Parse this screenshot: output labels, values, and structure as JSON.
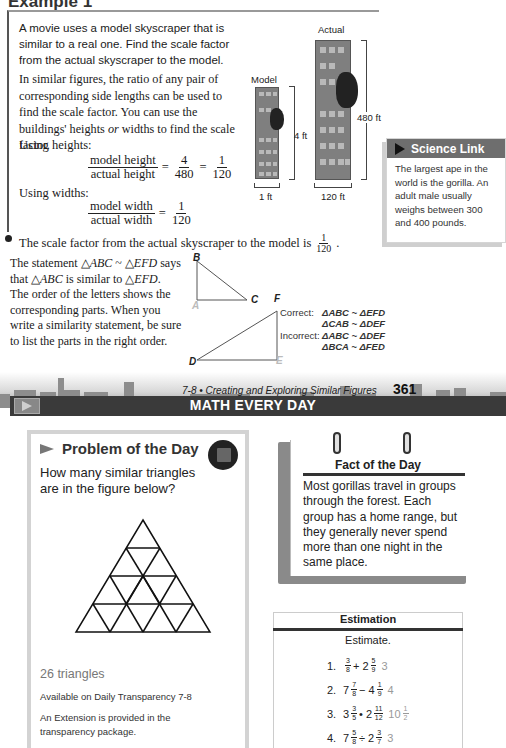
{
  "example": {
    "title": "Example 1",
    "intro": "A movie uses a model skyscraper that is similar to a real one. Find the scale factor from the actual skyscraper to the model.",
    "explain_pre": "In similar figures, the ratio of any pair of corresponding side lengths can be used to find the scale factor. You can use the buildings' heights ",
    "explain_or": "or",
    "explain_post": " widths to find the scale factor.",
    "using_heights": "Using heights:",
    "eq_heights": {
      "num1": "model height",
      "den1": "actual height",
      "eq": "=",
      "num2": "4",
      "den2": "480",
      "eq2": "=",
      "num3": "1",
      "den3": "120"
    },
    "using_widths": "Using widths:",
    "eq_widths": {
      "num1": "model width",
      "den1": "actual width",
      "eq": "=",
      "num2": "1",
      "den2": "120"
    },
    "conclusion": "The scale factor from the actual skyscraper to the model is",
    "conclusion_num": "1",
    "conclusion_den": "120",
    "conclusion_end": "."
  },
  "figure": {
    "model_label": "Model",
    "actual_label": "Actual",
    "model_height": "4 ft",
    "actual_height": "480 ft",
    "model_width": "1 ft",
    "actual_width": "120 ft"
  },
  "science_link": {
    "title": "Science Link",
    "body": "The largest ape in the world is the gorilla. An adult male usually weighs between 300 and 400 pounds."
  },
  "similarity": {
    "text_1": "The statement △",
    "abc": "ABC",
    "sim": " ~ △",
    "efd": "EFD",
    "text_2": " says that △",
    "abc2": "ABC",
    "text_3": " is similar to △",
    "efd2": "EFD",
    "text_4": ". The order of the letters shows the corresponding parts. When you write a similarity statement, be sure to list the parts in the right order.",
    "labels": {
      "A": "A",
      "B": "B",
      "C": "C",
      "D": "D",
      "E": "E",
      "F": "F"
    },
    "correct_label": "Correct:",
    "correct_1": "ΔABC ~ ΔEFD",
    "correct_2": "ΔCAB ~ ΔDEF",
    "incorrect_label": "Incorrect:",
    "incorrect_1": "ΔABC ~ ΔDEF",
    "incorrect_2": "ΔBCA ~ ΔFED"
  },
  "footer": {
    "section": "7-8 • Creating and Exploring Similar Figures",
    "page": "361"
  },
  "math_every_day": {
    "title": "MATH EVERY DAY"
  },
  "problem_of_day": {
    "title": "Problem of the Day",
    "question": "How many similar triangles are in the figure below?",
    "answer": "26 triangles",
    "available": "Available on Daily Transparency 7-8",
    "extension": "An Extension is provided in the transparency package."
  },
  "fact_of_day": {
    "title": "Fact of the Day",
    "body": "Most gorillas travel in groups through the forest. Each group has a home range, but they generally never spend more than one night in the same place."
  },
  "estimation": {
    "title": "Estimation",
    "subtitle": "Estimate.",
    "items": [
      {
        "n": "1.",
        "expr": [
          [
            "",
            "3",
            "8"
          ],
          [
            "+ 2",
            "5",
            "9"
          ]
        ],
        "ans": "3"
      },
      {
        "n": "2.",
        "expr": [
          [
            "7",
            "7",
            "8"
          ],
          [
            "− 4",
            "1",
            "9"
          ]
        ],
        "ans": "4"
      },
      {
        "n": "3.",
        "expr": [
          [
            "3",
            "3",
            "5"
          ],
          [
            "• 2",
            "11",
            "12"
          ]
        ],
        "ans_whole": "10",
        "ans_num": "1",
        "ans_den": "2"
      },
      {
        "n": "4.",
        "expr": [
          [
            "7",
            "5",
            "8"
          ],
          [
            "÷ 2",
            "3",
            "7"
          ]
        ],
        "ans": "3"
      }
    ]
  }
}
